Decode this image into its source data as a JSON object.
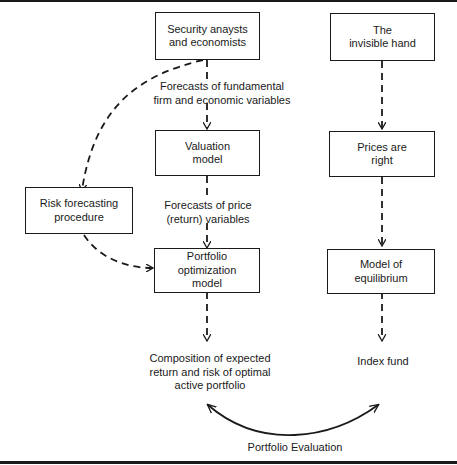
{
  "diagram": {
    "boxes": {
      "security_analysts": "Security anaysts\nand economists",
      "invisible_hand": "The\ninvisible hand",
      "valuation_model": "Valuation\nmodel",
      "prices_are_right": "Prices are\nright",
      "risk_forecasting": "Risk forecasting\nprocedure",
      "portfolio_optimization": "Portfolio\noptimization\nmodel",
      "model_of_equilibrium": "Model of\nequilibrium"
    },
    "labels": {
      "forecasts_fundamental": "Forecasts of fundamental\nfirm and economic variables",
      "forecasts_price": "Forecasts of price\n(return) variables",
      "composition": "Composition of expected\nreturn and risk of optimal\nactive portfolio",
      "index_fund": "Index fund",
      "portfolio_evaluation": "Portfolio Evaluation"
    }
  }
}
